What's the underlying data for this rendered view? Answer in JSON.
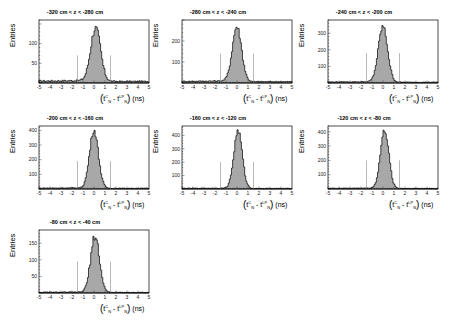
{
  "figure": {
    "y_axis_label": "Entries",
    "x_axis_label": {
      "open": "(",
      "t1": "t",
      "t1_sup": "C",
      "t1_sub": "N",
      "minus": " - ",
      "t2": "t",
      "t2_sup": "LP",
      "t2_sub": "N",
      "close": ")",
      "unit": " (ns)"
    },
    "colors": {
      "fill": "#a8a8a8",
      "line": "#000000",
      "cut_line": "#888888",
      "frame": "#000000"
    }
  },
  "panels": [
    {
      "title": "-320 cm < z < -280 cm"
    },
    {
      "title": "-280 cm < z < -240 cm"
    },
    {
      "title": "-240 cm < z < -200 cm"
    },
    {
      "title": "-200 cm < z < -160 cm"
    },
    {
      "title": "-160 cm < z < -120 cm"
    },
    {
      "title": "-120 cm < z < -80 cm"
    },
    {
      "title": "-80 cm < z < -40 cm"
    }
  ],
  "chart_data": [
    {
      "type": "bar",
      "title": "-320 cm < z < -280 cm",
      "xlabel": "(t_N^C - t_N^LP) (ns)",
      "ylabel": "Entries",
      "xlim": [
        -5,
        5
      ],
      "ylim": [
        0,
        160
      ],
      "yticks": [
        50,
        100
      ],
      "xticks": [
        -5,
        -4,
        -3,
        -2,
        -1,
        0,
        1,
        2,
        3,
        4,
        5
      ],
      "peak_x": 0.15,
      "peak_y": 135,
      "sigma": 0.45,
      "background": 5,
      "cut_lines_x": [
        -1.5,
        1.5
      ],
      "cut_line_height": 70
    },
    {
      "type": "bar",
      "title": "-280 cm < z < -240 cm",
      "xlabel": "(t_N^C - t_N^LP) (ns)",
      "ylabel": "Entries",
      "xlim": [
        -5,
        5
      ],
      "ylim": [
        0,
        300
      ],
      "yticks": [
        100,
        200
      ],
      "xticks": [
        -5,
        -4,
        -3,
        -2,
        -1,
        0,
        1,
        2,
        3,
        4,
        5
      ],
      "peak_x": 0.0,
      "peak_y": 260,
      "sigma": 0.42,
      "background": 8,
      "cut_lines_x": [
        -1.5,
        1.5
      ],
      "cut_line_height": 140
    },
    {
      "type": "bar",
      "title": "-240 cm < z < -200 cm",
      "xlabel": "(t_N^C - t_N^LP) (ns)",
      "ylabel": "Entries",
      "xlim": [
        -5,
        5
      ],
      "ylim": [
        0,
        380
      ],
      "yticks": [
        100,
        200,
        300
      ],
      "xticks": [
        -5,
        -4,
        -3,
        -2,
        -1,
        0,
        1,
        2,
        3,
        4,
        5
      ],
      "peak_x": 0.0,
      "peak_y": 335,
      "sigma": 0.42,
      "background": 6,
      "cut_lines_x": [
        -1.5,
        1.5
      ],
      "cut_line_height": 180
    },
    {
      "type": "bar",
      "title": "-200 cm < z < -160 cm",
      "xlabel": "(t_N^C - t_N^LP) (ns)",
      "ylabel": "Entries",
      "xlim": [
        -5,
        5
      ],
      "ylim": [
        0,
        430
      ],
      "yticks": [
        100,
        200,
        300,
        400
      ],
      "xticks": [
        -5,
        -4,
        -3,
        -2,
        -1,
        0,
        1,
        2,
        3,
        4,
        5
      ],
      "peak_x": 0.0,
      "peak_y": 395,
      "sigma": 0.4,
      "background": 6,
      "cut_lines_x": [
        -1.5,
        1.5
      ],
      "cut_line_height": 190
    },
    {
      "type": "bar",
      "title": "-160 cm < z < -120 cm",
      "xlabel": "(t_N^C - t_N^LP) (ns)",
      "ylabel": "Entries",
      "xlim": [
        -5,
        5
      ],
      "ylim": [
        0,
        470
      ],
      "yticks": [
        100,
        200,
        300,
        400
      ],
      "xticks": [
        -5,
        -4,
        -3,
        -2,
        -1,
        0,
        1,
        2,
        3,
        4,
        5
      ],
      "peak_x": 0.1,
      "peak_y": 430,
      "sigma": 0.38,
      "background": 5,
      "cut_lines_x": [
        -1.5,
        1.5
      ],
      "cut_line_height": 200
    },
    {
      "type": "bar",
      "title": "-120 cm < z < -80 cm",
      "xlabel": "(t_N^C - t_N^LP) (ns)",
      "ylabel": "Entries",
      "xlim": [
        -5,
        5
      ],
      "ylim": [
        0,
        440
      ],
      "yticks": [
        100,
        200,
        300,
        400
      ],
      "xticks": [
        -5,
        -4,
        -3,
        -2,
        -1,
        0,
        1,
        2,
        3,
        4,
        5
      ],
      "peak_x": 0.15,
      "peak_y": 405,
      "sigma": 0.38,
      "background": 5,
      "cut_lines_x": [
        -1.5,
        1.5
      ],
      "cut_line_height": 200
    },
    {
      "type": "bar",
      "title": "-80 cm < z < -40 cm",
      "xlabel": "(t_N^C - t_N^LP) (ns)",
      "ylabel": "Entries",
      "xlim": [
        -5,
        5
      ],
      "ylim": [
        0,
        190
      ],
      "yticks": [
        50,
        100,
        150
      ],
      "xticks": [
        -5,
        -4,
        -3,
        -2,
        -1,
        0,
        1,
        2,
        3,
        4,
        5
      ],
      "peak_x": 0.1,
      "peak_y": 170,
      "sigma": 0.4,
      "background": 2,
      "cut_lines_x": [
        -1.5,
        1.5
      ],
      "cut_line_height": 95
    }
  ]
}
